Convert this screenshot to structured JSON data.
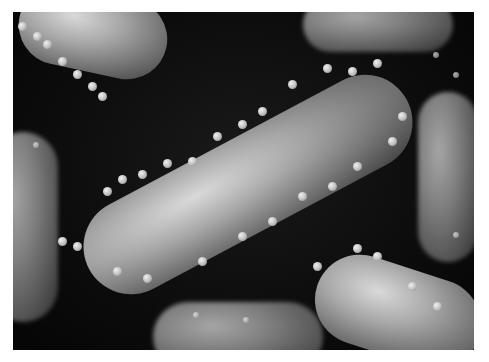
{
  "image": {
    "description": "Grayscale 3D render of rod-shaped bacteria covered with bacteriophages on a dark background",
    "palette": {
      "background": "#0b0b0b",
      "cell_light": "#d9d9d9",
      "cell_dark": "#3a3a3a",
      "border": "#ffffff"
    }
  }
}
